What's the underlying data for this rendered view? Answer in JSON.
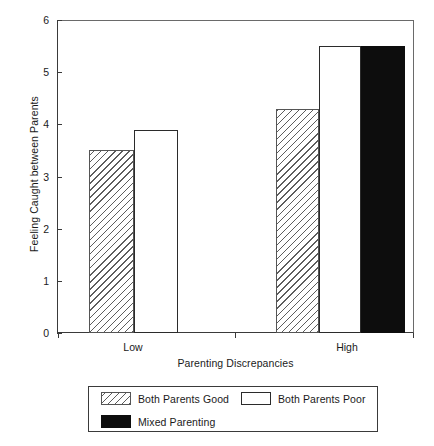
{
  "chart_data": {
    "type": "bar",
    "title": "",
    "xlabel": "Parenting Discrepancies",
    "ylabel": "Feeling Caught between Parents",
    "categories": [
      "Low",
      "High"
    ],
    "series": [
      {
        "name": "Both Parents Good",
        "pattern": "hatched",
        "values": [
          3.5,
          4.3
        ]
      },
      {
        "name": "Both Parents Poor",
        "pattern": "white",
        "values": [
          3.9,
          5.5
        ]
      },
      {
        "name": "Mixed Parenting",
        "pattern": "black",
        "values": [
          null,
          5.5
        ]
      }
    ],
    "ylim": [
      0,
      6
    ],
    "yticks": [
      0,
      1,
      2,
      3,
      4,
      5,
      6
    ],
    "ytick_labels": [
      "0",
      "1",
      "2",
      "3",
      "4",
      "5",
      "6"
    ],
    "grid": false,
    "legend_position": "below-axes",
    "colors": {
      "axis": "#3a3a3a",
      "bar_outline": "#2b2b2b",
      "hatch": "#5d5d5d",
      "black_fill": "#0d0d0d",
      "background": "#ffffff"
    }
  },
  "axes": {
    "y_title": "Feeling Caught between Parents",
    "x_title": "Parenting Discrepancies",
    "y_ticks": [
      {
        "value": 6,
        "label": "6"
      },
      {
        "value": 5,
        "label": "5"
      },
      {
        "value": 4,
        "label": "4"
      },
      {
        "value": 3,
        "label": "3"
      },
      {
        "value": 2,
        "label": "2"
      },
      {
        "value": 1,
        "label": "1"
      },
      {
        "value": 0,
        "label": "0"
      }
    ],
    "x_ticks": [
      {
        "label": "Low"
      },
      {
        "label": "High"
      }
    ]
  },
  "bars": [
    {
      "group": "Low",
      "series": "Both Parents Good",
      "value": 3.5,
      "fill": "fill-hatch",
      "left": 32,
      "width": 45
    },
    {
      "group": "Low",
      "series": "Both Parents Poor",
      "value": 3.9,
      "fill": "fill-white",
      "left": 77,
      "width": 44
    },
    {
      "group": "High",
      "series": "Both Parents Good",
      "value": 4.3,
      "fill": "fill-hatch",
      "left": 219,
      "width": 43
    },
    {
      "group": "High",
      "series": "Both Parents Poor",
      "value": 5.5,
      "fill": "fill-white",
      "left": 262,
      "width": 42
    },
    {
      "group": "High",
      "series": "Mixed Parenting",
      "value": 5.5,
      "fill": "fill-black",
      "left": 304,
      "width": 44
    }
  ],
  "legend": {
    "entries": [
      {
        "label": "Both Parents Good",
        "swatch": "sw-hatch"
      },
      {
        "label": "Both Parents Poor",
        "swatch": "sw-white"
      },
      {
        "label": "Mixed Parenting",
        "swatch": "sw-black"
      }
    ]
  }
}
